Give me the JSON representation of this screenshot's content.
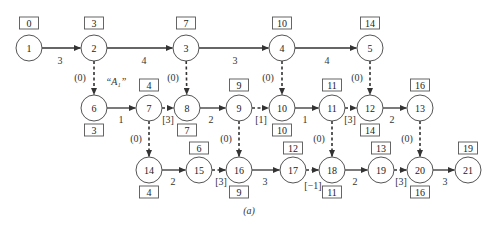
{
  "diagram": {
    "type": "activity-on-arrow network",
    "caption": "(a)",
    "annotation": {
      "text": "“A₁”",
      "x": 116,
      "y": 82
    },
    "node_radius": 13,
    "nodes": [
      {
        "id": "1",
        "x": 29,
        "y": 48
      },
      {
        "id": "2",
        "x": 94,
        "y": 48
      },
      {
        "id": "3",
        "x": 186,
        "y": 48
      },
      {
        "id": "4",
        "x": 282,
        "y": 48
      },
      {
        "id": "5",
        "x": 370,
        "y": 48
      },
      {
        "id": "6",
        "x": 94,
        "y": 108
      },
      {
        "id": "7",
        "x": 149,
        "y": 108
      },
      {
        "id": "8",
        "x": 187,
        "y": 108
      },
      {
        "id": "9",
        "x": 239,
        "y": 108
      },
      {
        "id": "10",
        "x": 282,
        "y": 108
      },
      {
        "id": "11",
        "x": 332,
        "y": 108
      },
      {
        "id": "12",
        "x": 370,
        "y": 108
      },
      {
        "id": "13",
        "x": 420,
        "y": 108
      },
      {
        "id": "14",
        "x": 149,
        "y": 170
      },
      {
        "id": "15",
        "x": 199,
        "y": 170
      },
      {
        "id": "16",
        "x": 239,
        "y": 170
      },
      {
        "id": "17",
        "x": 293,
        "y": 170
      },
      {
        "id": "18",
        "x": 332,
        "y": 170
      },
      {
        "id": "19",
        "x": 381,
        "y": 170
      },
      {
        "id": "20",
        "x": 420,
        "y": 170
      },
      {
        "id": "21",
        "x": 468,
        "y": 170
      }
    ],
    "boxes": [
      {
        "node": "1",
        "value": "0",
        "x": 29,
        "y": 23
      },
      {
        "node": "2",
        "value": "3",
        "x": 94,
        "y": 23
      },
      {
        "node": "3",
        "value": "7",
        "x": 186,
        "y": 23
      },
      {
        "node": "4",
        "value": "10",
        "x": 282,
        "y": 23
      },
      {
        "node": "5",
        "value": "14",
        "x": 370,
        "y": 23
      },
      {
        "node": "7",
        "value": "4",
        "x": 149,
        "y": 85
      },
      {
        "node": "9",
        "value": "9",
        "x": 239,
        "y": 85
      },
      {
        "node": "11",
        "value": "11",
        "x": 332,
        "y": 85
      },
      {
        "node": "13",
        "value": "16",
        "x": 420,
        "y": 85
      },
      {
        "node": "6",
        "value": "3",
        "x": 94,
        "y": 130
      },
      {
        "node": "8",
        "value": "7",
        "x": 187,
        "y": 130
      },
      {
        "node": "10",
        "value": "10",
        "x": 282,
        "y": 130
      },
      {
        "node": "12",
        "value": "14",
        "x": 370,
        "y": 130
      },
      {
        "node": "15",
        "value": "6",
        "x": 199,
        "y": 148
      },
      {
        "node": "17",
        "value": "12",
        "x": 293,
        "y": 148
      },
      {
        "node": "19",
        "value": "13",
        "x": 381,
        "y": 148
      },
      {
        "node": "21",
        "value": "19",
        "x": 468,
        "y": 148
      },
      {
        "node": "14",
        "value": "4",
        "x": 149,
        "y": 192
      },
      {
        "node": "16",
        "value": "9",
        "x": 239,
        "y": 192
      },
      {
        "node": "18",
        "value": "11",
        "x": 332,
        "y": 192
      },
      {
        "node": "20",
        "value": "16",
        "x": 420,
        "y": 192
      }
    ],
    "edges": [
      {
        "from": "1",
        "to": "2",
        "label": "3",
        "style": "solid",
        "lx": 60,
        "ly": 60
      },
      {
        "from": "2",
        "to": "3",
        "label": "4",
        "style": "solid",
        "lx": 144,
        "ly": 60
      },
      {
        "from": "3",
        "to": "4",
        "label": "3",
        "style": "solid",
        "lx": 235,
        "ly": 60
      },
      {
        "from": "4",
        "to": "5",
        "label": "4",
        "style": "solid",
        "lx": 327,
        "ly": 60
      },
      {
        "from": "2",
        "to": "6",
        "label": "(0)",
        "style": "dashed",
        "lx": 80,
        "ly": 77
      },
      {
        "from": "3",
        "to": "8",
        "label": "(0)",
        "style": "dashed",
        "lx": 173,
        "ly": 77
      },
      {
        "from": "4",
        "to": "10",
        "label": "(0)",
        "style": "dashed",
        "lx": 268,
        "ly": 77
      },
      {
        "from": "5",
        "to": "12",
        "label": "(0)",
        "style": "dashed",
        "lx": 357,
        "ly": 77
      },
      {
        "from": "6",
        "to": "7",
        "label": "1",
        "style": "solid",
        "lx": 121,
        "ly": 119
      },
      {
        "from": "7",
        "to": "8",
        "label": "[3]",
        "style": "dashed",
        "lx": 168,
        "ly": 119
      },
      {
        "from": "8",
        "to": "9",
        "label": "2",
        "style": "solid",
        "lx": 211,
        "ly": 119
      },
      {
        "from": "9",
        "to": "10",
        "label": "[1]",
        "style": "dashed",
        "lx": 261,
        "ly": 119
      },
      {
        "from": "10",
        "to": "11",
        "label": "1",
        "style": "solid",
        "lx": 305,
        "ly": 119
      },
      {
        "from": "11",
        "to": "12",
        "label": "[3]",
        "style": "dashed",
        "lx": 350,
        "ly": 119
      },
      {
        "from": "12",
        "to": "13",
        "label": "2",
        "style": "solid",
        "lx": 392,
        "ly": 119
      },
      {
        "from": "7",
        "to": "14",
        "label": "(0)",
        "style": "dashed",
        "lx": 136,
        "ly": 138
      },
      {
        "from": "9",
        "to": "16",
        "label": "(0)",
        "style": "dashed",
        "lx": 226,
        "ly": 138
      },
      {
        "from": "11",
        "to": "18",
        "label": "(0)",
        "style": "dashed",
        "lx": 319,
        "ly": 138
      },
      {
        "from": "13",
        "to": "20",
        "label": "(0)",
        "style": "dashed",
        "lx": 407,
        "ly": 138
      },
      {
        "from": "14",
        "to": "15",
        "label": "2",
        "style": "solid",
        "lx": 173,
        "ly": 181
      },
      {
        "from": "15",
        "to": "16",
        "label": "[3]",
        "style": "dashed",
        "lx": 221,
        "ly": 181
      },
      {
        "from": "16",
        "to": "17",
        "label": "3",
        "style": "solid",
        "lx": 265,
        "ly": 181
      },
      {
        "from": "17",
        "to": "18",
        "label": "[−1]",
        "style": "dashed",
        "lx": 313,
        "ly": 185
      },
      {
        "from": "18",
        "to": "19",
        "label": "2",
        "style": "solid",
        "lx": 355,
        "ly": 181
      },
      {
        "from": "19",
        "to": "20",
        "label": "[3]",
        "style": "dashed",
        "lx": 401,
        "ly": 181
      },
      {
        "from": "20",
        "to": "21",
        "label": "3",
        "style": "solid",
        "lx": 445,
        "ly": 181
      }
    ]
  }
}
